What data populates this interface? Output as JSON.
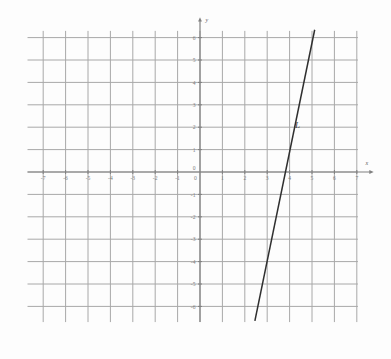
{
  "figure": {
    "background_color": "#fdfdfd",
    "grid_color": "#a8a8a8",
    "axis_color": "#808080",
    "line_color": "#2f2f2f",
    "tick_label_color": "#7e7e7e"
  },
  "chart_data": {
    "type": "line",
    "title": "",
    "xlabel": "x",
    "ylabel": "y",
    "xlim": [
      -7.7,
      7.7
    ],
    "ylim": [
      -6.9,
      6.7
    ],
    "grid": true,
    "grid_step": 1,
    "legend": "none",
    "x_ticks": [
      -7,
      -6,
      -5,
      -4,
      -3,
      -2,
      -1,
      0,
      1,
      2,
      3,
      4,
      5,
      6,
      7
    ],
    "x_tick_labels": [
      "-7",
      "-6",
      "-5",
      "-4",
      "-3",
      "-2",
      "-1",
      "0",
      "1",
      "2",
      "3",
      "4",
      "5",
      "6",
      "7"
    ],
    "y_ticks": [
      6,
      5,
      4,
      3,
      2,
      1,
      0,
      -1,
      -2,
      -3,
      -4,
      -5,
      -6
    ],
    "y_tick_labels": [
      "6",
      "5",
      "4",
      "3",
      "2",
      "1",
      "0",
      "-1",
      "-2",
      "-3",
      "-4",
      "-5",
      "-6"
    ],
    "grid_x_range": [
      -7.7,
      7.05
    ],
    "grid_y_range": [
      -6.7,
      6.3
    ],
    "series": [
      {
        "name": "L",
        "label": "L",
        "label_position": {
          "x": 4.35,
          "y": 1.95
        },
        "slope": 3,
        "intercept": -9,
        "equation": "y = 3x - 9",
        "x_intercept": 3,
        "points": [
          {
            "x": 2.45,
            "y": -6.65
          },
          {
            "x": 3,
            "y": 0
          },
          {
            "x": 4,
            "y": 3
          },
          {
            "x": 5.12,
            "y": 6.35
          }
        ]
      }
    ],
    "annotations": [
      {
        "text": "L",
        "x": 4.35,
        "y": 1.95,
        "style": "italic"
      },
      {
        "text": "x",
        "x": 7.45,
        "y": 0.32,
        "style": "italic-axis"
      },
      {
        "text": "y",
        "x": 0.3,
        "y": 6.7,
        "style": "italic-axis"
      }
    ]
  }
}
